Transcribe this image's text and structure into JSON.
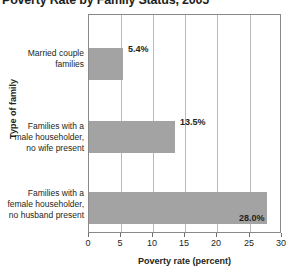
{
  "chart_data": {
    "type": "bar",
    "orientation": "horizontal",
    "title": "Poverty Rate by Family Status, 2005",
    "xlabel": "Poverty rate (percent)",
    "ylabel": "Type of family",
    "categories": [
      "Married couple families",
      "Families with a male householder, no wife present",
      "Families with a female householder, no husband present"
    ],
    "category_lines": [
      [
        "Married couple",
        "families"
      ],
      [
        "Families with a",
        "male householder,",
        "no wife present"
      ],
      [
        "Families with a",
        "female householder,",
        "no husband present"
      ]
    ],
    "values": [
      5.4,
      13.5,
      28.0
    ],
    "value_labels": [
      "5.4%",
      "13.5%",
      "28.0%"
    ],
    "xlim": [
      0,
      30
    ],
    "xticks": [
      0,
      5,
      10,
      15,
      20,
      25,
      30
    ],
    "xtick_labels": [
      "0",
      "5",
      "10",
      "15",
      "20",
      "25",
      "30"
    ],
    "grid": "vertical",
    "legend": null,
    "bar_color": "#a3a3a3",
    "grid_color": "#b9b9b9",
    "frame_color": "#8a8a8a",
    "text_color": "#231f20"
  }
}
